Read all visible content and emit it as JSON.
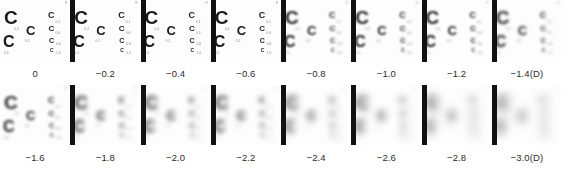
{
  "figure": {
    "units_label": "(D)",
    "background_color": "#ffffff",
    "optotype_color": "#1a1a1a",
    "separator_color": "#111111",
    "acuity_label_color": "#8d8d8d"
  },
  "chart_template": {
    "corner_mark": "R",
    "optotypes": [
      {
        "id": "c-0-1-big",
        "glyph": "C",
        "size_px": 19,
        "x": 4,
        "y": 8,
        "acuity": "0.1"
      },
      {
        "id": "c-0-2-mid",
        "glyph": "C",
        "size_px": 13,
        "x": 26,
        "y": 24,
        "acuity": "0.2"
      },
      {
        "id": "c-0-4-big",
        "glyph": "C",
        "size_px": 16,
        "x": 3,
        "y": 34,
        "acuity": "0.4"
      },
      {
        "id": "c-0-1-sm",
        "glyph": "C",
        "size_px": 9,
        "x": 48,
        "y": 11,
        "acuity": "0.1"
      },
      {
        "id": "c-0-6-sm",
        "glyph": "C",
        "size_px": 8,
        "x": 48.5,
        "y": 25,
        "acuity": "0.6"
      },
      {
        "id": "c-0-8-sm",
        "glyph": "C",
        "size_px": 7,
        "x": 49,
        "y": 37,
        "acuity": "0.8"
      },
      {
        "id": "c-1-0-xs",
        "glyph": "C",
        "size_px": 5,
        "x": 50,
        "y": 48,
        "acuity": "1.0"
      }
    ],
    "acuity_labels": [
      {
        "text": "0.4",
        "x": 14,
        "y": 28
      },
      {
        "text": "0.2",
        "x": 25,
        "y": 40
      },
      {
        "text": "0.1",
        "x": 55.5,
        "y": 21
      },
      {
        "text": "0.6",
        "x": 55.5,
        "y": 32
      },
      {
        "text": "0.8",
        "x": 56,
        "y": 43
      },
      {
        "text": "1.0",
        "x": 56,
        "y": 52
      },
      {
        "text": "0.5",
        "x": 4,
        "y": 52
      }
    ]
  },
  "chart_data": {
    "type": "heatmap",
    "xlabel": "Defocus (D)",
    "ylabel": "",
    "grid": false,
    "legend": "none",
    "rows": 2,
    "columns": 8,
    "series": [
      {
        "name": "Defocus blur level",
        "values": [
          0,
          -0.2,
          -0.4,
          -0.6,
          -0.8,
          -1.0,
          -1.2,
          -1.4,
          -1.6,
          -1.8,
          -2.0,
          -2.2,
          -2.4,
          -2.6,
          -2.8,
          -3.0
        ]
      }
    ],
    "categories": [
      "0",
      "-0.2",
      "-0.4",
      "-0.6",
      "-0.8",
      "-1.0",
      "-1.2",
      "-1.4",
      "-1.6",
      "-1.8",
      "-2.0",
      "-2.2",
      "-2.4",
      "-2.6",
      "-2.8",
      "-3.0"
    ],
    "panels": [
      {
        "index": 0,
        "row": 0,
        "col": 0,
        "defocus_d": 0,
        "caption": "0",
        "blur_px": 0.25
      },
      {
        "index": 1,
        "row": 0,
        "col": 1,
        "defocus_d": -0.2,
        "caption": "−0.2",
        "blur_px": 0.35
      },
      {
        "index": 2,
        "row": 0,
        "col": 2,
        "defocus_d": -0.4,
        "caption": "−0.4",
        "blur_px": 0.5
      },
      {
        "index": 3,
        "row": 0,
        "col": 3,
        "defocus_d": -0.6,
        "caption": "−0.6",
        "blur_px": 0.65
      },
      {
        "index": 4,
        "row": 0,
        "col": 4,
        "defocus_d": -0.8,
        "caption": "−0.8",
        "blur_px": 0.8
      },
      {
        "index": 5,
        "row": 0,
        "col": 5,
        "defocus_d": -1.0,
        "caption": "−1.0",
        "blur_px": 1.0
      },
      {
        "index": 6,
        "row": 0,
        "col": 6,
        "defocus_d": -1.2,
        "caption": "−1.2",
        "blur_px": 1.2
      },
      {
        "index": 7,
        "row": 0,
        "col": 7,
        "defocus_d": -1.4,
        "caption": "−1.4(D)",
        "blur_px": 1.4
      },
      {
        "index": 8,
        "row": 1,
        "col": 0,
        "defocus_d": -1.6,
        "caption": "−1.6",
        "blur_px": 1.7
      },
      {
        "index": 9,
        "row": 1,
        "col": 1,
        "defocus_d": -1.8,
        "caption": "−1.8",
        "blur_px": 2.0
      },
      {
        "index": 10,
        "row": 1,
        "col": 2,
        "defocus_d": -2.0,
        "caption": "−2.0",
        "blur_px": 2.4
      },
      {
        "index": 11,
        "row": 1,
        "col": 3,
        "defocus_d": -2.2,
        "caption": "−2.2",
        "blur_px": 2.8
      },
      {
        "index": 12,
        "row": 1,
        "col": 4,
        "defocus_d": -2.4,
        "caption": "−2.4",
        "blur_px": 3.2
      },
      {
        "index": 13,
        "row": 1,
        "col": 5,
        "defocus_d": -2.6,
        "caption": "−2.6",
        "blur_px": 3.7
      },
      {
        "index": 14,
        "row": 1,
        "col": 6,
        "defocus_d": -2.8,
        "caption": "−2.8",
        "blur_px": 4.2
      },
      {
        "index": 15,
        "row": 1,
        "col": 7,
        "defocus_d": -3.0,
        "caption": "−3.0(D)",
        "blur_px": 4.8
      }
    ]
  }
}
